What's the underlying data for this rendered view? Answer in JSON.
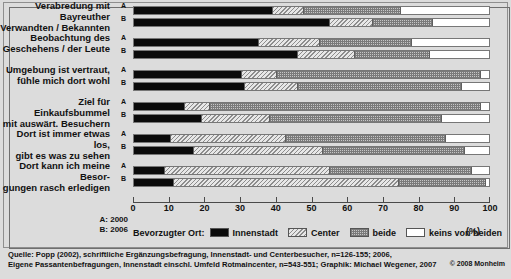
{
  "chart_data": {
    "type": "bar",
    "title": "",
    "subtitle": "",
    "orientation": "horizontal",
    "stacked": true,
    "xlabel": "(%)",
    "ylabel": "",
    "xlim": [
      0,
      100
    ],
    "xticks": [
      0,
      10,
      20,
      30,
      40,
      50,
      60,
      70,
      80,
      90,
      100
    ],
    "grid": false,
    "legend_position": "bottom",
    "legend_title": "Bevorzugter Ort:",
    "series": [
      {
        "name": "Innenstadt",
        "key": "innenstadt"
      },
      {
        "name": "Center",
        "key": "center"
      },
      {
        "name": "beide",
        "key": "beide"
      },
      {
        "name": "keins von beiden",
        "key": "keins"
      }
    ],
    "group_labels": {
      "A": "A: 2000",
      "B": "B: 2006"
    },
    "categories": [
      "Verabredung mit Bayreuther Verwandten / Bekannten",
      "Beobachtung des Geschehens / der Leute",
      "Umgebung ist vertraut, fühle mich dort wohl",
      "Ziel für Einkaufsbummel mit auswärt. Besuchern",
      "Dort ist immer etwas los, gibt es was zu sehen",
      "Dort kann ich meine Besorgungen rasch erledigen"
    ],
    "groups": [
      {
        "label_lines": [
          "Verabredung mit Bayreuther",
          "Verwandten / Bekannten"
        ],
        "rows": [
          {
            "mark": "A",
            "values": [
              39.0,
              8.5,
              27.5,
              25.0
            ]
          },
          {
            "mark": "B",
            "values": [
              55.0,
              12.0,
              17.0,
              16.0
            ]
          }
        ]
      },
      {
        "label_lines": [
          "Beobachtung des",
          "Geschehens / der Leute"
        ],
        "rows": [
          {
            "mark": "A",
            "values": [
              35.0,
              17.0,
              26.0,
              22.0
            ]
          },
          {
            "mark": "B",
            "values": [
              46.0,
              16.0,
              21.0,
              17.0
            ]
          }
        ]
      },
      {
        "label_lines": [
          "Umgebung ist vertraut,",
          "fühle mich dort wohl"
        ],
        "rows": [
          {
            "mark": "A",
            "values": [
              30.0,
              10.0,
              57.5,
              2.5
            ]
          },
          {
            "mark": "B",
            "values": [
              31.0,
              15.0,
              46.0,
              8.0
            ]
          }
        ]
      },
      {
        "label_lines": [
          "Ziel für Einkaufsbummel",
          "mit auswärt. Besuchern"
        ],
        "rows": [
          {
            "mark": "A",
            "values": [
              14.0,
              7.0,
              76.5,
              2.5
            ]
          },
          {
            "mark": "B",
            "values": [
              19.0,
              19.0,
              48.5,
              13.5
            ]
          }
        ]
      },
      {
        "label_lines": [
          "Dort ist immer etwas los,",
          "gibt es was zu sehen"
        ],
        "rows": [
          {
            "mark": "A",
            "values": [
              10.0,
              32.5,
              45.0,
              12.5
            ]
          },
          {
            "mark": "B",
            "values": [
              16.5,
              36.5,
              40.0,
              7.0
            ]
          }
        ]
      },
      {
        "label_lines": [
          "Dort kann ich meine Besor-",
          "gungen rasch erledigen"
        ],
        "rows": [
          {
            "mark": "A",
            "values": [
              8.5,
              46.5,
              40.0,
              5.0
            ]
          },
          {
            "mark": "B",
            "values": [
              11.0,
              63.5,
              24.5,
              1.0
            ]
          }
        ]
      }
    ]
  },
  "axis": {
    "unit_label": "(%)",
    "tick_labels": [
      "0",
      "10",
      "20",
      "30",
      "40",
      "50",
      "60",
      "70",
      "80",
      "90",
      "100"
    ]
  },
  "ab_legend": {
    "line_a": "A: 2000",
    "line_b": "B: 2006"
  },
  "legend": {
    "title": "Bevorzugter Ort:",
    "items": [
      {
        "label": "Innenstadt",
        "swatch": "innenstadt"
      },
      {
        "label": "Center",
        "swatch": "center"
      },
      {
        "label": "beide",
        "swatch": "beide"
      },
      {
        "label": "keins von beiden",
        "swatch": "keins"
      }
    ]
  },
  "source": {
    "line1": "Quelle: Popp (2002), schriftliche Ergänzungsbefragung, Innenstadt- und Centerbesucher, n=126-155; 2006,",
    "line2": "Eigene Passantenbefragungen, Innenstadt einschl. Umfeld Rotmaincenter, n=543-551; Graphik: Michael Wegener, 2007",
    "copyright": "© 2008 Monheim"
  }
}
